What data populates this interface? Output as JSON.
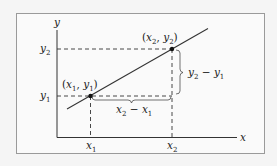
{
  "diagram": {
    "colors": {
      "background": "#f5f5f5",
      "frame": "#9a9a9a",
      "ink": "#222222"
    },
    "axes": {
      "x_label": "x",
      "y_label": "y"
    },
    "ticks": {
      "x1": {
        "base": "x",
        "sub": "1"
      },
      "x2": {
        "base": "x",
        "sub": "2"
      },
      "y1": {
        "base": "y",
        "sub": "1"
      },
      "y2": {
        "base": "y",
        "sub": "2"
      }
    },
    "points": [
      {
        "id": "p1",
        "label_open": "(",
        "x": "x",
        "xsub": "1",
        "sep": ", ",
        "y": "y",
        "ysub": "1",
        "label_close": ")"
      },
      {
        "id": "p2",
        "label_open": "(",
        "x": "x",
        "xsub": "2",
        "sep": ", ",
        "y": "y",
        "ysub": "2",
        "label_close": ")"
      }
    ],
    "braces": {
      "run": {
        "a": "x",
        "asub": "2",
        "op": " − ",
        "b": "x",
        "bsub": "1"
      },
      "rise": {
        "a": "y",
        "asub": "2",
        "op": " − ",
        "b": "y",
        "bsub": "1"
      }
    }
  }
}
